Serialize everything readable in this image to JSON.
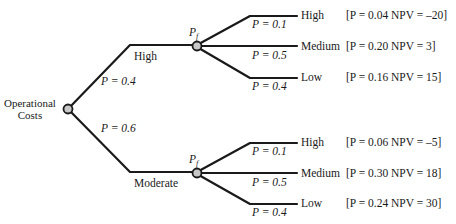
{
  "diagram": {
    "type": "decision-tree",
    "root": {
      "label_line1": "Operational",
      "label_line2": "Costs"
    },
    "branches": [
      {
        "outcome": "High",
        "prob_label": "P = 0.4",
        "node_label": "P",
        "node_sub": "f",
        "leaves": [
          {
            "prob_label": "P = 0.1",
            "outcome": "High",
            "result_p": "0.04",
            "result_npv": "–20",
            "result_text": "[P = 0.04  NPV = –20]"
          },
          {
            "prob_label": "P = 0.5",
            "outcome": "Medium",
            "result_p": "0.20",
            "result_npv": "3",
            "result_text": "[P = 0.20  NPV = 3]"
          },
          {
            "prob_label": "P = 0.4",
            "outcome": "Low",
            "result_p": "0.16",
            "result_npv": "15",
            "result_text": "[P = 0.16  NPV = 15]"
          }
        ]
      },
      {
        "outcome": "Moderate",
        "prob_label": "P = 0.6",
        "node_label": "P",
        "node_sub": "f",
        "leaves": [
          {
            "prob_label": "P = 0.1",
            "outcome": "High",
            "result_p": "0.06",
            "result_npv": "–5",
            "result_text": "[P = 0.06  NPV = –5]"
          },
          {
            "prob_label": "P = 0.5",
            "outcome": "Medium",
            "result_p": "0.30",
            "result_npv": "18",
            "result_text": "[P = 0.30  NPV = 18]"
          },
          {
            "prob_label": "P = 0.4",
            "outcome": "Low",
            "result_p": "0.24",
            "result_npv": "30",
            "result_text": "[P = 0.24  NPV = 30]"
          }
        ]
      }
    ],
    "colors": {
      "line": "#1a1a1a",
      "node_fill": "#c8c8c8",
      "node_stroke": "#1a1a1a"
    }
  }
}
